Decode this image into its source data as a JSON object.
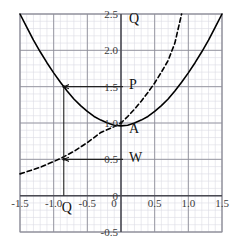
{
  "chart_data": {
    "type": "line",
    "title": "",
    "xlabel": "",
    "ylabel": "",
    "xlim": [
      -1.5,
      1.5
    ],
    "ylim": [
      -0.5,
      2.5
    ],
    "grid": true,
    "grid_major_step": 0.5,
    "grid_minor_step": 0.1,
    "legend": "none",
    "xticks": [
      "-1.5",
      "-1.0",
      "-0.5",
      "0",
      "0.5",
      "1.0",
      "1.5"
    ],
    "xtick_values": [
      -1.5,
      -1.0,
      -0.5,
      0,
      0.5,
      1.0,
      1.5
    ],
    "yticks": [
      "2.5",
      "2.0",
      "1.5",
      "1.0",
      "0.5",
      "0",
      "-0.5"
    ],
    "ytick_values": [
      2.5,
      2.0,
      1.5,
      1.0,
      0.5,
      0,
      -0.5
    ],
    "series": [
      {
        "name": "parabola",
        "style": "solid",
        "color": "#000000",
        "x": [
          -1.5,
          -1.4,
          -1.3,
          -1.2,
          -1.1,
          -1.0,
          -0.9,
          -0.8,
          -0.7,
          -0.6,
          -0.5,
          -0.4,
          -0.3,
          -0.2,
          -0.1,
          0.0,
          0.1,
          0.2,
          0.3,
          0.4,
          0.5,
          0.6,
          0.7,
          0.8,
          0.9,
          1.0,
          1.1,
          1.2,
          1.3,
          1.4,
          1.5
        ],
        "y": [
          2.5,
          2.32,
          2.14,
          1.98,
          1.83,
          1.69,
          1.56,
          1.44,
          1.33,
          1.24,
          1.16,
          1.09,
          1.04,
          1.0,
          0.97,
          0.96,
          0.97,
          1.0,
          1.04,
          1.09,
          1.16,
          1.24,
          1.33,
          1.44,
          1.56,
          1.69,
          1.83,
          1.98,
          2.14,
          2.32,
          2.5
        ]
      },
      {
        "name": "exponential",
        "style": "dashed",
        "color": "#000000",
        "x": [
          -1.5,
          -1.4,
          -1.3,
          -1.2,
          -1.1,
          -1.0,
          -0.9,
          -0.8,
          -0.7,
          -0.6,
          -0.5,
          -0.4,
          -0.3,
          -0.2,
          -0.1,
          0.0,
          0.1,
          0.2,
          0.3,
          0.4,
          0.5,
          0.6,
          0.7,
          0.8,
          0.9
        ],
        "y": [
          0.3,
          0.33,
          0.36,
          0.39,
          0.43,
          0.47,
          0.51,
          0.56,
          0.61,
          0.67,
          0.73,
          0.8,
          0.87,
          0.91,
          0.95,
          1.0,
          1.09,
          1.19,
          1.3,
          1.42,
          1.55,
          1.7,
          1.86,
          2.1,
          2.5
        ]
      }
    ],
    "annotations": [
      {
        "label": "Q",
        "name": "label-q-top",
        "x": 0.12,
        "y": 2.38,
        "role": "axis-top-label"
      },
      {
        "label": "P",
        "name": "label-p",
        "x": 0.12,
        "y": 1.47,
        "role": "y-value-label"
      },
      {
        "label": "A",
        "name": "label-a",
        "x": 0.12,
        "y": 0.86,
        "role": "intersection-label"
      },
      {
        "label": "W",
        "name": "label-w",
        "x": 0.12,
        "y": 0.46,
        "role": "y-value-label"
      },
      {
        "label": "Q",
        "name": "label-q-bottom",
        "x": -0.88,
        "y": -0.22,
        "role": "x-value-label"
      }
    ],
    "construction_lines": [
      {
        "name": "arrow-to-parabola",
        "type": "arrow",
        "from": [
          0.03,
          1.5
        ],
        "to": [
          -0.85,
          1.5
        ]
      },
      {
        "name": "arrow-to-exponential",
        "type": "arrow",
        "from": [
          0.03,
          0.5
        ],
        "to": [
          -0.85,
          0.5
        ]
      },
      {
        "name": "vertical-drop",
        "type": "segment",
        "from": [
          -0.85,
          1.5
        ],
        "to": [
          -0.85,
          0.0
        ]
      }
    ],
    "marked_points": [
      {
        "name": "point-on-parabola",
        "x": -0.85,
        "y": 1.5
      },
      {
        "name": "point-on-exponential",
        "x": -0.85,
        "y": 0.5
      },
      {
        "name": "point-a",
        "x": 0.0,
        "y": 1.0
      }
    ]
  },
  "style": {
    "grid_minor_color": "#dcdce4",
    "grid_major_color": "#8f8f9a",
    "axis_color": "#4a4a52",
    "curve_color": "#111111",
    "background": "#ffffff"
  }
}
